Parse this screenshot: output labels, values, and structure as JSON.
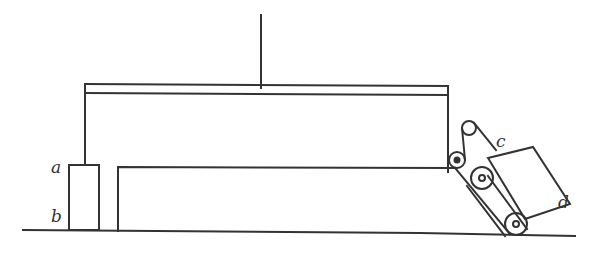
{
  "diagram": {
    "type": "mechanical apparatus schematic",
    "labels": {
      "a": "a",
      "b": "b",
      "c": "c",
      "d": "d"
    },
    "colors": {
      "line": "#333333",
      "background": "#ffffff"
    },
    "components": [
      "vertical-suspension-rod",
      "horizontal-beam",
      "left-support-post",
      "box-ab",
      "long-block",
      "guide-pulley-small",
      "guide-pulley-upper",
      "tilted-carriage-cd",
      "roller-upper",
      "roller-lower",
      "ground-line"
    ]
  }
}
